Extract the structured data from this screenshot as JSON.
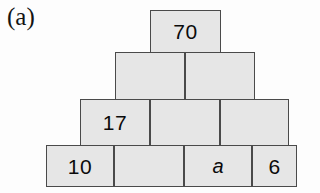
{
  "figure": {
    "label": "(a)",
    "type": "number-pyramid",
    "colors": {
      "block_fill": "#e6e6e6",
      "block_border": "#4a4a4a",
      "text": "#0b0b0b",
      "background": "#fdfdfd"
    },
    "rows": [
      {
        "row_index": 1,
        "left": 150,
        "top": 10,
        "width": 71,
        "height": 43,
        "cells": [
          {
            "value": "70",
            "style": "normal",
            "width": 71
          }
        ]
      },
      {
        "row_index": 2,
        "left": 115,
        "top": 52,
        "width": 140,
        "height": 48,
        "cells": [
          {
            "value": "",
            "style": "normal",
            "width": 70
          },
          {
            "value": "",
            "style": "normal",
            "width": 70
          }
        ]
      },
      {
        "row_index": 3,
        "left": 80,
        "top": 99,
        "width": 209,
        "height": 47,
        "cells": [
          {
            "value": "17",
            "style": "normal",
            "width": 70
          },
          {
            "value": "",
            "style": "normal",
            "width": 70
          },
          {
            "value": "",
            "style": "normal",
            "width": 69
          }
        ]
      },
      {
        "row_index": 4,
        "left": 46,
        "top": 145,
        "width": 251,
        "height": 42,
        "cells": [
          {
            "value": "10",
            "style": "normal",
            "width": 68
          },
          {
            "value": "",
            "style": "normal",
            "width": 70
          },
          {
            "value": "a",
            "style": "italic",
            "width": 68
          },
          {
            "value": "6",
            "style": "normal",
            "width": 45
          }
        ]
      }
    ]
  }
}
